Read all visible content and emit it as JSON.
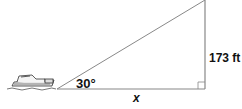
{
  "diagram": {
    "type": "right-triangle",
    "labels": {
      "height": "173 ft",
      "angle": "30°",
      "base": "x"
    },
    "elements": [
      "boat",
      "hypotenuse",
      "base",
      "vertical-side",
      "right-angle-marker"
    ],
    "colors": {
      "lines": "#888888",
      "text": "#111111"
    }
  }
}
